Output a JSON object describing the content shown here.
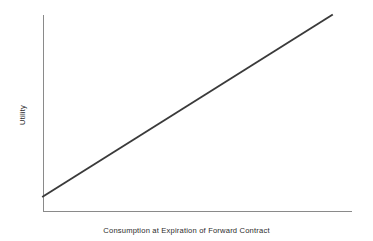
{
  "chart_data": {
    "type": "line",
    "title": "",
    "subtitle": "",
    "xlabel": "Consumption at Expiration of Forward Contract",
    "ylabel": "Utility",
    "grid": false,
    "legend": false,
    "legend_position": "none",
    "xticks": [],
    "yticks": [],
    "xlim": [
      0,
      1
    ],
    "ylim": [
      0,
      1
    ],
    "annotations": [],
    "series": [
      {
        "name": "Utility of consumption (risk-neutral, linear)",
        "color": "#3a3a3a",
        "x": [
          0.0,
          1.0
        ],
        "y": [
          0.074,
          1.0
        ],
        "points": [
          {
            "x": 0.0,
            "y": 0.074
          },
          {
            "x": 1.0,
            "y": 1.0
          }
        ]
      }
    ],
    "axes": {
      "x_axis_color": "#8a8a8a",
      "y_axis_color": "#8a8a8a",
      "shows_ticks": false,
      "shows_tick_labels": false
    }
  },
  "geometry": {
    "plot_left": 43,
    "plot_right": 352,
    "plot_top": 15,
    "plot_bottom": 211,
    "line_start_x": 43,
    "line_start_y": 200,
    "line_end_x": 332,
    "line_end_y": 55
  },
  "figure": {
    "background": "#ffffff",
    "width": 373,
    "height": 241
  }
}
